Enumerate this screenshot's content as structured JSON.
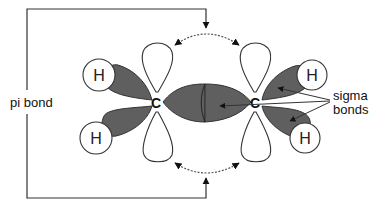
{
  "diagram": {
    "labels": {
      "pi_bond": "pi bond",
      "sigma_line1": "sigma",
      "sigma_line2": "bonds"
    },
    "atoms": {
      "carbon_left": "C",
      "carbon_right": "C",
      "hydrogen_top_left": "H",
      "hydrogen_bottom_left": "H",
      "hydrogen_top_right": "H",
      "hydrogen_bottom_right": "H"
    },
    "colors": {
      "sigma_lobe_fill": "#5f5f5f",
      "p_orbital_fill": "#ffffff",
      "outline": "#333333",
      "text": "#111111"
    }
  }
}
